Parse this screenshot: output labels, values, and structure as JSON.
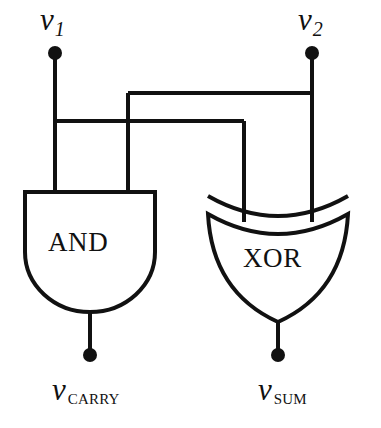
{
  "diagram": {
    "type": "logic-circuit",
    "stroke_color": "#111111",
    "background_color": "#ffffff"
  },
  "inputs": [
    {
      "id": "v1",
      "base": "v",
      "sub": "1",
      "sub_style": "italic",
      "terminal": {
        "x": 55,
        "y": 53
      }
    },
    {
      "id": "v2",
      "base": "v",
      "sub": "2",
      "sub_style": "italic",
      "terminal": {
        "x": 312,
        "y": 53
      }
    }
  ],
  "outputs": [
    {
      "id": "vcarry",
      "base": "v",
      "sub": "CARRY",
      "sub_style": "smallcaps",
      "terminal": {
        "x": 90,
        "y": 355
      }
    },
    {
      "id": "vsum",
      "base": "v",
      "sub": "SUM",
      "sub_style": "smallcaps",
      "terminal": {
        "x": 278,
        "y": 355
      }
    }
  ],
  "gates": [
    {
      "id": "and",
      "label": "AND",
      "shape": "d-shape",
      "orientation": "inputs-top",
      "output": "vcarry"
    },
    {
      "id": "xor",
      "label": "XOR",
      "shape": "shield-double-arc",
      "orientation": "inputs-top",
      "output": "vsum"
    }
  ],
  "wires": [
    {
      "from": "v1",
      "to": "and-input-left",
      "path": "vertical"
    },
    {
      "from": "v1",
      "to": "xor-input-left",
      "path": "down-right-down"
    },
    {
      "from": "v2",
      "to": "xor-input-right",
      "path": "vertical"
    },
    {
      "from": "v2",
      "to": "and-input-right",
      "path": "down-left-down"
    }
  ],
  "geometry": {
    "bus_upper_y": 93,
    "bus_lower_y": 121,
    "v1_x": 55,
    "v2_x": 312,
    "and_right_input_x": 128,
    "xor_left_input_x": 244,
    "and_gate": {
      "left": 25,
      "right": 155,
      "top": 192,
      "bottom": 312
    },
    "xor_gate": {
      "left": 208,
      "right": 348,
      "top": 200,
      "bottom": 322
    }
  }
}
